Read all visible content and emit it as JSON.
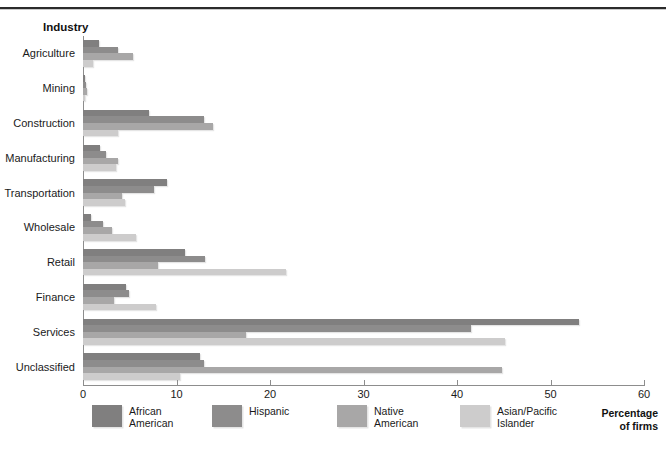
{
  "heading": {
    "industry_label": "Industry"
  },
  "axis": {
    "title": "Percentage\nof firms",
    "ticks": [
      "0",
      "10",
      "20",
      "30",
      "40",
      "50",
      "60"
    ]
  },
  "legend": [
    {
      "label": "African\nAmerican",
      "color": "#807f7f"
    },
    {
      "label": "Hispanic",
      "color": "#8d8c8c"
    },
    {
      "label": "Native\nAmerican",
      "color": "#a8a7a7"
    },
    {
      "label": "Asian/Pacific\nIslander",
      "color": "#cdcccc"
    }
  ],
  "chart_data": {
    "type": "bar",
    "title": "",
    "orientation": "horizontal",
    "xlabel": "Percentage of firms",
    "ylabel": "Industry",
    "xlim": [
      0,
      60
    ],
    "xticks": [
      0,
      10,
      20,
      30,
      40,
      50,
      60
    ],
    "grid": false,
    "legend_position": "bottom",
    "categories": [
      "Agriculture",
      "Mining",
      "Construction",
      "Manufacturing",
      "Transportation",
      "Wholesale",
      "Retail",
      "Finance",
      "Services",
      "Unclassified"
    ],
    "series": [
      {
        "name": "African American",
        "color": "#807f7f",
        "values": [
          1.7,
          0.2,
          7.1,
          1.8,
          9.0,
          0.9,
          10.9,
          4.6,
          53.1,
          12.5
        ]
      },
      {
        "name": "Hispanic",
        "color": "#8d8c8c",
        "values": [
          3.7,
          0.3,
          12.9,
          2.5,
          7.6,
          2.1,
          13.1,
          4.9,
          41.5,
          12.9
        ]
      },
      {
        "name": "Native American",
        "color": "#a8a7a7",
        "values": [
          5.3,
          0.4,
          13.9,
          3.7,
          4.2,
          3.1,
          8.0,
          3.3,
          17.4,
          44.8
        ]
      },
      {
        "name": "Asian/Pacific Islander",
        "color": "#cdcccc",
        "values": [
          1.1,
          0.2,
          3.7,
          3.5,
          4.5,
          5.7,
          21.7,
          7.8,
          45.1,
          10.4
        ]
      }
    ]
  }
}
